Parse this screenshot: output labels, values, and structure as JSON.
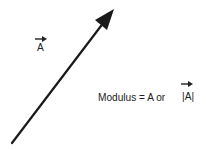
{
  "diagram": {
    "vector_label": "A",
    "modulus_text": "Modulus = A  or",
    "modulus_abs": "|A|",
    "colors": {
      "arrow": "#1a1a1a",
      "text": "#222222",
      "background": "#ffffff"
    }
  }
}
